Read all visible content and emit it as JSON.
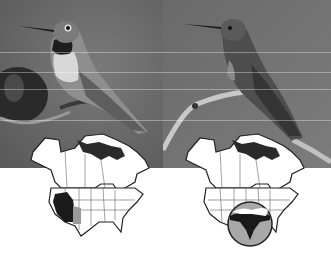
{
  "figure": {
    "panels": [
      {
        "id": "left",
        "photo": {
          "subject": "hummingbird perched, dark throat gorget, pale chest",
          "tone": "grayscale"
        },
        "map": {
          "region": "North America",
          "highlight": "western United States range (dark) with southern extension (gray)",
          "icon": "range-map-icon"
        }
      },
      {
        "id": "right",
        "photo": {
          "subject": "hummingbird perched on curved branch, long bill",
          "tone": "grayscale"
        },
        "map": {
          "region": "North America",
          "highlight": "southeastern/Gulf region shown in circular magnifier inset",
          "icon": "range-map-icon"
        }
      }
    ],
    "colors": {
      "photo_bg_left": "#6a6a6a",
      "photo_bg_right": "#707070",
      "map_fill": "#ffffff",
      "map_stroke": "#222222",
      "range_dark": "#1a1a1a",
      "range_gray": "#9a9a9a",
      "inset_fill": "#a8a8a8"
    }
  }
}
